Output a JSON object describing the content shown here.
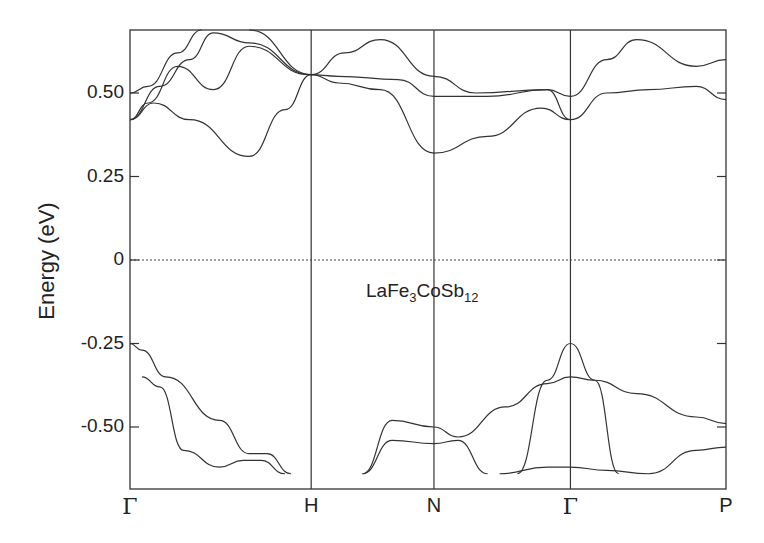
{
  "chart_data": {
    "type": "line",
    "title": "",
    "xlabel": "",
    "ylabel": "Energy (eV)",
    "annotation": {
      "base": "LaFe",
      "sub1": "3",
      "mid": "CoSb",
      "sub2": "12"
    },
    "ylim": [
      -0.64,
      0.73
    ],
    "yticks": [
      "0.50",
      "0.25",
      "0",
      "-0.25",
      "-0.50"
    ],
    "ytick_values": [
      0.5,
      0.25,
      0,
      -0.25,
      -0.5
    ],
    "xticks": [
      "Γ",
      "H",
      "N",
      "Γ",
      "P"
    ],
    "xtick_positions": [
      0,
      0.304,
      0.51,
      0.739,
      1.0
    ],
    "fermi_level": 0,
    "grid": false,
    "bands": [
      {
        "name": "cb1",
        "x": [
          0,
          0.04,
          0.1,
          0.2,
          0.26,
          0.304
        ],
        "y": [
          0.42,
          0.47,
          0.42,
          0.31,
          0.45,
          0.555
        ]
      },
      {
        "name": "cb2",
        "x": [
          0,
          0.03,
          0.08,
          0.14,
          0.2,
          0.3,
          0.35,
          0.45,
          0.51,
          0.6,
          0.7,
          0.739
        ],
        "y": [
          0.42,
          0.47,
          0.58,
          0.51,
          0.64,
          0.555,
          0.55,
          0.54,
          0.49,
          0.49,
          0.51,
          0.42
        ]
      },
      {
        "name": "cb3",
        "x": [
          0,
          0.05,
          0.1,
          0.14,
          0.2,
          0.304
        ],
        "y": [
          0.42,
          0.52,
          0.6,
          0.68,
          0.65,
          0.555
        ]
      },
      {
        "name": "cb4",
        "x": [
          0,
          0.03,
          0.08,
          0.12
        ],
        "y": [
          0.5,
          0.52,
          0.62,
          0.73
        ]
      },
      {
        "name": "cb5",
        "x": [
          0.304,
          0.35,
          0.42,
          0.51,
          0.6,
          0.69,
          0.739
        ],
        "y": [
          0.555,
          0.53,
          0.51,
          0.32,
          0.37,
          0.455,
          0.42
        ]
      },
      {
        "name": "cb6",
        "x": [
          0.2,
          0.304,
          0.36,
          0.42,
          0.51,
          0.58,
          0.7,
          0.739
        ],
        "y": [
          0.73,
          0.555,
          0.62,
          0.66,
          0.55,
          0.5,
          0.51,
          0.49
        ]
      },
      {
        "name": "cb7",
        "x": [
          0.739,
          0.8,
          0.87,
          0.95,
          1.0
        ],
        "y": [
          0.42,
          0.5,
          0.51,
          0.52,
          0.48
        ]
      },
      {
        "name": "cb8",
        "x": [
          0.739,
          0.8,
          0.85,
          0.95,
          1.0
        ],
        "y": [
          0.49,
          0.6,
          0.66,
          0.58,
          0.6
        ]
      },
      {
        "name": "vb1",
        "x": [
          0,
          0.02,
          0.06,
          0.15,
          0.2,
          0.23,
          0.27
        ],
        "y": [
          -0.25,
          -0.27,
          -0.35,
          -0.48,
          -0.58,
          -0.58,
          -0.64
        ]
      },
      {
        "name": "vb2",
        "x": [
          0.02,
          0.05,
          0.09,
          0.15,
          0.19,
          0.22,
          0.26
        ],
        "y": [
          -0.35,
          -0.38,
          -0.57,
          -0.62,
          -0.6,
          -0.6,
          -0.64
        ]
      },
      {
        "name": "vb3",
        "x": [
          0.39,
          0.44,
          0.51,
          0.55,
          0.63,
          0.7,
          0.739,
          0.78,
          0.85,
          0.95,
          1.0
        ],
        "y": [
          -0.64,
          -0.48,
          -0.5,
          -0.53,
          -0.44,
          -0.37,
          -0.35,
          -0.36,
          -0.4,
          -0.47,
          -0.49
        ]
      },
      {
        "name": "vb4",
        "x": [
          0.39,
          0.44,
          0.51,
          0.55,
          0.6
        ],
        "y": [
          -0.64,
          -0.54,
          -0.55,
          -0.54,
          -0.64
        ]
      },
      {
        "name": "vb5",
        "x": [
          0.65,
          0.7,
          0.739,
          0.78,
          0.82
        ],
        "y": [
          -0.64,
          -0.36,
          -0.25,
          -0.36,
          -0.64
        ]
      },
      {
        "name": "vb6",
        "x": [
          0.62,
          0.7,
          0.739,
          0.8,
          0.87,
          0.95,
          1.0
        ],
        "y": [
          -0.64,
          -0.62,
          -0.62,
          -0.63,
          -0.64,
          -0.57,
          -0.56
        ]
      }
    ]
  }
}
